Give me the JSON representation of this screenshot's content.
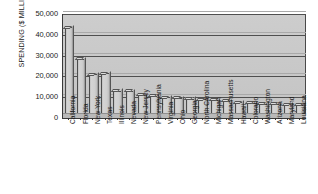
{
  "chart_data": {
    "type": "bar",
    "title": "",
    "xlabel": "",
    "ylabel": "SPENDING ($ MILLIONS)",
    "ylim": [
      0,
      50000
    ],
    "yticks": [
      0,
      10000,
      20000,
      30000,
      40000,
      50000
    ],
    "ytick_labels": [
      "0",
      "10,000",
      "20,000",
      "30,000",
      "40,000",
      "50,000"
    ],
    "grid": true,
    "legend": "none",
    "categories": [
      "California",
      "Florida",
      "New York",
      "Texas",
      "Illinois",
      "Nevada",
      "New Jersey",
      "Pennsylvania",
      "Virginia",
      "Ohio",
      "Georgia",
      "North Carolina",
      "Michigan",
      "Massachusetts",
      "Hawaii",
      "Colorado",
      "Washington",
      "Arizona",
      "Maryland",
      "Louisiana"
    ],
    "values": [
      43700,
      28500,
      21000,
      21500,
      13200,
      13000,
      11200,
      10600,
      10000,
      9600,
      9300,
      9000,
      8700,
      8300,
      7600,
      7200,
      6900,
      6700,
      6500,
      6300
    ],
    "bar_color": "#cccccc",
    "bar_edge_color": "#4d4d4d",
    "plot_background": "#c9c9c9"
  },
  "axis": {
    "y_title": "SPENDING ($ MILLIONS)"
  }
}
